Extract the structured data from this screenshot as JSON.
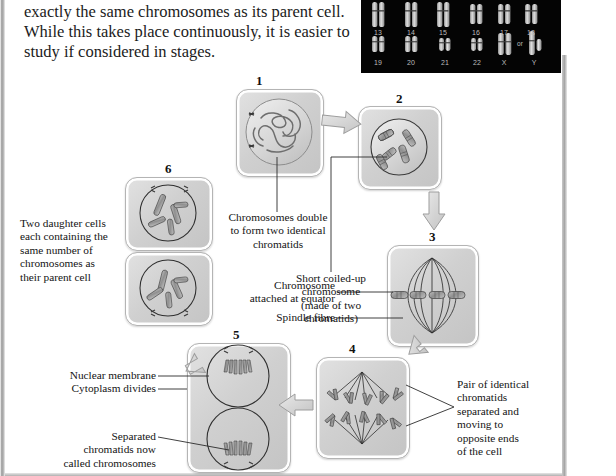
{
  "document": {
    "intro_paragraph": "exactly the same chromosomes as its parent cell. While this takes place continuously, it is easier to study if considered in stages."
  },
  "karyotype": {
    "caption_rows": [
      {
        "labels": [
          "13",
          "14",
          "15",
          "16",
          "17",
          "18"
        ]
      },
      {
        "labels": [
          "19",
          "20",
          "21",
          "22",
          "X",
          "Y"
        ]
      }
    ],
    "or_label": "or",
    "background_color": "#040404",
    "chromosome_color": "#c8c8c8"
  },
  "diagram": {
    "stages": [
      {
        "number": "1",
        "name": "interphase-cell"
      },
      {
        "number": "2",
        "name": "prophase-cell"
      },
      {
        "number": "3",
        "name": "metaphase-cell"
      },
      {
        "number": "4",
        "name": "anaphase-cell"
      },
      {
        "number": "5",
        "name": "telophase-cell"
      },
      {
        "number": "6",
        "name": "daughter-cells"
      }
    ],
    "labels": {
      "chromosomes_double": "Chromosomes double\nto form two identical\nchromatids",
      "short_coiled": "Short coiled-up\nchromosome\n(made of two\nchromatids)",
      "chromosome_equator": "Chromosome\nattached at equator",
      "spindle_fibre": "Spindle fibre",
      "pair_identical": "Pair of identical\nchromatids\nseparated and\nmoving to\nopposite ends\nof the cell",
      "nuclear_membrane": "Nuclear membrane",
      "cytoplasm_divides": "Cytoplasm divides",
      "separated_chromatids": "Separated\nchromatids now\ncalled chromosomes",
      "two_daughter_cells": "Two daughter cells\neach containing the\nsame number of\nchromosomes as\ntheir parent cell"
    },
    "colors": {
      "stage_fill": "#d4d4d4",
      "outline": "#2b2b2b",
      "arrow_fill": "#d6d6d6",
      "text": "#141414"
    }
  }
}
